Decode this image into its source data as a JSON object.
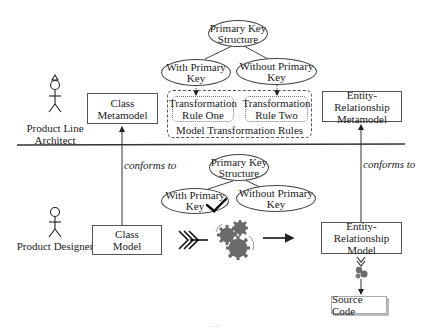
{
  "actors": {
    "architect": {
      "label": "Product Line Architect",
      "line1": "Product Line",
      "line2": "Architect"
    },
    "designer": {
      "label": "Product Designer"
    }
  },
  "metamodel_layer": {
    "class_metamodel": {
      "line1": "Class",
      "line2": "Metamodel"
    },
    "er_metamodel": {
      "line1": "Entity-Relationship",
      "line2": "Metamodel"
    },
    "feature_tree": {
      "root": {
        "line1": "Primary Key",
        "line2": "Structure"
      },
      "with_pk": {
        "line1": "With Primary",
        "line2": "Key"
      },
      "without_pk": {
        "line1": "Without Primary",
        "line2": "Key"
      }
    },
    "rules_group": {
      "title": "Model Transformation Rules",
      "rule_one": {
        "line1": "Transformation",
        "line2": "Rule One"
      },
      "rule_two": {
        "line1": "Transformation",
        "line2": "Rule Two"
      }
    }
  },
  "model_layer": {
    "class_model": {
      "line1": "Class",
      "line2": "Model"
    },
    "er_model": {
      "line1": "Entity-Relationship",
      "line2": "Model"
    },
    "feature_tree": {
      "root": {
        "line1": "Primary Key",
        "line2": "Structure"
      },
      "with_pk": {
        "line1": "With Primary",
        "line2": "Key",
        "selected": true
      },
      "without_pk": {
        "line1": "Without Primary",
        "line2": "Key"
      }
    },
    "source_code": "Source Code"
  },
  "relations": {
    "left_conforms": "conforms to",
    "right_conforms": "conforms to"
  },
  "icons": {
    "chevron": "fletching-chevron-icon",
    "gears": "gears-icon",
    "checkmark": "checkmark-icon"
  },
  "colors": {
    "stroke": "#444444",
    "gear": "#6b6b6b",
    "divider": "#333333"
  },
  "caption": "     ...   "
}
